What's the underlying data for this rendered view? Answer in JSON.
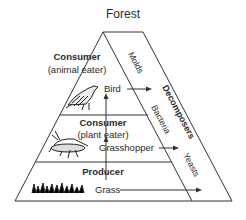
{
  "title": "Forest",
  "levels": [
    {
      "role": "Consumer",
      "subrole": "(animal eater)",
      "organism": "Bird",
      "icon": "bird-icon"
    },
    {
      "role": "Consumer",
      "subrole": "(plant eater)",
      "organism": "Grasshopper",
      "icon": "grasshopper-icon"
    },
    {
      "role": "Producer",
      "subrole": "",
      "organism": "Grass",
      "icon": "grass-icon"
    }
  ],
  "decomposers": {
    "label": "Decomposers",
    "types": [
      "Molds",
      "Bacteria",
      "Yeasts"
    ]
  }
}
